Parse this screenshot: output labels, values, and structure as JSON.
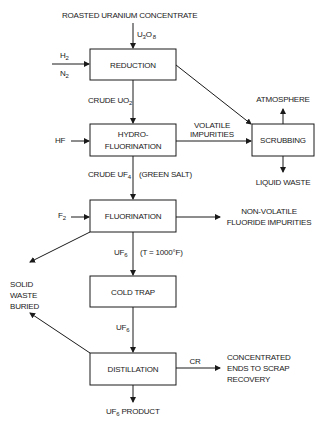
{
  "diagram": {
    "feed": {
      "top_label": "ROASTED URANIUM CONCENTRATE",
      "u3o8": {
        "base": "U",
        "sub1": "3",
        "mid": "O",
        "sub2": "8"
      }
    },
    "inputs": {
      "h2": {
        "base": "H",
        "sub": "2"
      },
      "n2": {
        "base": "N",
        "sub": "2"
      },
      "hf": "HF",
      "f2": {
        "base": "F",
        "sub": "2"
      }
    },
    "boxes": {
      "reduction": "REDUCTION",
      "hydro_line1": "HYDRO-",
      "hydro_line2": "FLUORINATION",
      "fluorination": "FLUORINATION",
      "cold_trap": "COLD TRAP",
      "distillation": "DISTILLATION",
      "scrubbing": "SCRUBBING"
    },
    "streams": {
      "crude_uo2": {
        "base": "CRUDE UO",
        "sub": "2"
      },
      "crude_uf4": {
        "base": "CRUDE UF",
        "sub": "4"
      },
      "green_salt": "(GREEN SALT)",
      "uf6_hot": {
        "base": "UF",
        "sub": "6"
      },
      "temp": "(T = 1000°F)",
      "uf6_cold": {
        "base": "UF",
        "sub": "6"
      },
      "product": {
        "base": "UF",
        "sub": "6",
        "suffix": " PRODUCT"
      },
      "volatile_line1": "VOLATILE",
      "volatile_line2": "IMPURITIES",
      "cr": "CR"
    },
    "outputs": {
      "atmosphere": "ATMOSPHERE",
      "liquid_waste": "LIQUID WASTE",
      "nonvolatile_line1": "NON-VOLATILE",
      "nonvolatile_line2": "FLUORIDE IMPURITIES",
      "solid_line1": "SOLID",
      "solid_line2": "WASTE",
      "solid_line3": "BURIED",
      "scrap_line1": "CONCENTRATED",
      "scrap_line2": "ENDS TO SCRAP",
      "scrap_line3": "RECOVERY"
    }
  }
}
